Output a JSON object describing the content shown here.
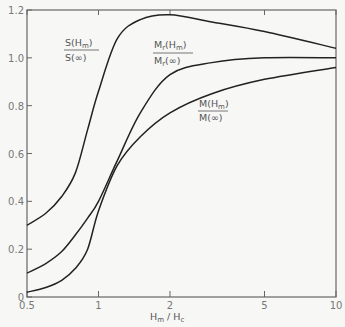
{
  "chart_data": {
    "type": "line",
    "title": "",
    "xlabel": "Hm / Hc",
    "ylabel": "",
    "xscale": "log",
    "xlim": [
      0.5,
      10
    ],
    "ylim": [
      0,
      1.2
    ],
    "x_ticks": [
      "0.5",
      "1",
      "2",
      "5",
      "10"
    ],
    "y_ticks": [
      "0",
      "0.2",
      "0.4",
      "0.6",
      "0.8",
      "1.0",
      "1.2"
    ],
    "grid": false,
    "legend": "inline labels",
    "series": [
      {
        "name": "S(Hm)/S(∞)",
        "x": [
          0.5,
          0.6,
          0.7,
          0.8,
          0.9,
          1.0,
          1.2,
          1.5,
          2.0,
          3.0,
          5.0,
          10.0
        ],
        "y": [
          0.3,
          0.35,
          0.42,
          0.52,
          0.7,
          0.86,
          1.08,
          1.16,
          1.18,
          1.15,
          1.11,
          1.04
        ]
      },
      {
        "name": "Mr(Hm)/Mr(∞)",
        "x": [
          0.5,
          0.6,
          0.7,
          0.8,
          0.9,
          1.0,
          1.2,
          1.5,
          2.0,
          3.0,
          5.0,
          10.0
        ],
        "y": [
          0.1,
          0.14,
          0.19,
          0.26,
          0.33,
          0.4,
          0.57,
          0.77,
          0.93,
          0.98,
          1.0,
          1.0
        ]
      },
      {
        "name": "M(Hm)/M(∞)",
        "x": [
          0.5,
          0.6,
          0.7,
          0.8,
          0.9,
          1.0,
          1.2,
          1.5,
          2.0,
          3.0,
          5.0,
          10.0
        ],
        "y": [
          0.02,
          0.04,
          0.07,
          0.12,
          0.2,
          0.36,
          0.55,
          0.67,
          0.77,
          0.85,
          0.91,
          0.96
        ]
      }
    ],
    "labels": {
      "s": {
        "num": "S(H",
        "sub": "m",
        "close": ")",
        "den": "S(∞)"
      },
      "mr": {
        "num": "M",
        "numsub": "r",
        "num2": "(H",
        "sub": "m",
        "close": ")",
        "den": "M",
        "densub": "r",
        "den2": "(∞)"
      },
      "m": {
        "num": "M(H",
        "sub": "m",
        "close": ")",
        "den": "M(∞)"
      },
      "x": {
        "a": "H",
        "asub": "m",
        "slash": " / ",
        "b": "H",
        "bsub": "c"
      }
    }
  }
}
